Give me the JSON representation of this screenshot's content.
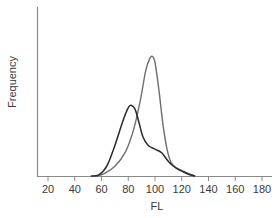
{
  "chart_data": {
    "type": "line",
    "title": "",
    "xlabel": "FL",
    "ylabel": "Frequency",
    "xlim": [
      10,
      190
    ],
    "ylim": [
      0,
      1
    ],
    "x_ticks": [
      20,
      40,
      60,
      80,
      100,
      120,
      140,
      160,
      180
    ],
    "y_ticks": [],
    "grid": false,
    "legend": null,
    "series": [
      {
        "name": "Distribution A (dark, bimodal-shoulder)",
        "color": "#2a2a2a",
        "points": [
          {
            "x": 52,
            "y": 0.0
          },
          {
            "x": 58,
            "y": 0.01
          },
          {
            "x": 64,
            "y": 0.08
          },
          {
            "x": 70,
            "y": 0.25
          },
          {
            "x": 76,
            "y": 0.45
          },
          {
            "x": 80,
            "y": 0.56
          },
          {
            "x": 82,
            "y": 0.58
          },
          {
            "x": 85,
            "y": 0.55
          },
          {
            "x": 88,
            "y": 0.44
          },
          {
            "x": 91,
            "y": 0.32
          },
          {
            "x": 95,
            "y": 0.25
          },
          {
            "x": 100,
            "y": 0.22
          },
          {
            "x": 105,
            "y": 0.19
          },
          {
            "x": 110,
            "y": 0.12
          },
          {
            "x": 115,
            "y": 0.07
          },
          {
            "x": 120,
            "y": 0.04
          },
          {
            "x": 125,
            "y": 0.015
          },
          {
            "x": 130,
            "y": 0.0
          }
        ]
      },
      {
        "name": "Distribution B (gray, unimodal)",
        "color": "#6e6e6e",
        "points": [
          {
            "x": 56,
            "y": 0.0
          },
          {
            "x": 62,
            "y": 0.02
          },
          {
            "x": 70,
            "y": 0.08
          },
          {
            "x": 78,
            "y": 0.2
          },
          {
            "x": 84,
            "y": 0.38
          },
          {
            "x": 89,
            "y": 0.62
          },
          {
            "x": 93,
            "y": 0.86
          },
          {
            "x": 96,
            "y": 0.96
          },
          {
            "x": 98,
            "y": 0.98
          },
          {
            "x": 100,
            "y": 0.93
          },
          {
            "x": 103,
            "y": 0.7
          },
          {
            "x": 106,
            "y": 0.42
          },
          {
            "x": 109,
            "y": 0.22
          },
          {
            "x": 112,
            "y": 0.11
          },
          {
            "x": 117,
            "y": 0.06
          },
          {
            "x": 123,
            "y": 0.03
          },
          {
            "x": 130,
            "y": 0.0
          }
        ]
      }
    ]
  },
  "axes": {
    "x_title": "FL",
    "y_title": "Frequency",
    "x_tick_labels": [
      "20",
      "40",
      "60",
      "80",
      "100",
      "120",
      "140",
      "160",
      "180"
    ]
  },
  "colors": {
    "axis": "#8a8a8a",
    "text": "#3a3a3a",
    "series_a": "#2a2a2a",
    "series_b": "#6e6e6e"
  }
}
